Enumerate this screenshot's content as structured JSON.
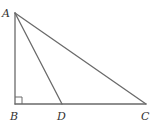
{
  "diagram": {
    "type": "geometry-triangle",
    "stroke_color": "#6a6a6a",
    "label_color": "#333333",
    "vertices": {
      "A": {
        "label": "A",
        "x": 15,
        "y": 13
      },
      "B": {
        "label": "B",
        "x": 15,
        "y": 104
      },
      "C": {
        "label": "C",
        "x": 146,
        "y": 104
      },
      "D": {
        "label": "D",
        "x": 62,
        "y": 104
      }
    },
    "segments": [
      "AB",
      "BC",
      "AC",
      "AD"
    ],
    "right_angle_at": "B",
    "labels": {
      "A": "A",
      "B": "B",
      "C": "C",
      "D": "D"
    }
  }
}
